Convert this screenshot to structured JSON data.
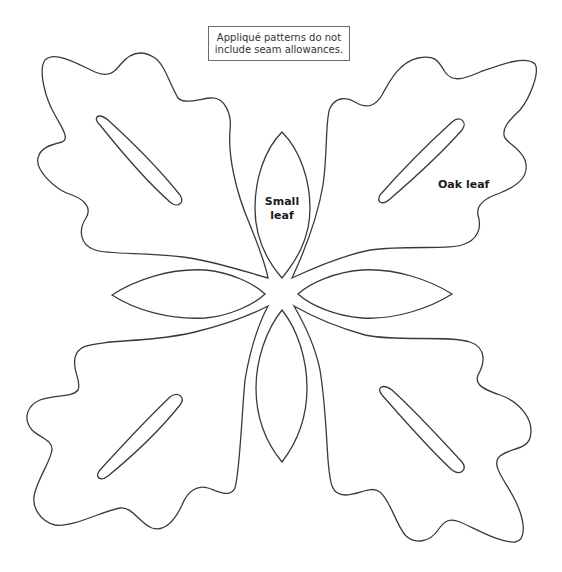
{
  "notice": {
    "line1": "Appliqué patterns do not",
    "line2": "include seam allowances."
  },
  "labels": {
    "small_leaf_line1": "Small",
    "small_leaf_line2": "leaf",
    "oak_leaf": "Oak leaf"
  },
  "colors": {
    "stroke": "#3a3a3a",
    "background": "#ffffff"
  }
}
